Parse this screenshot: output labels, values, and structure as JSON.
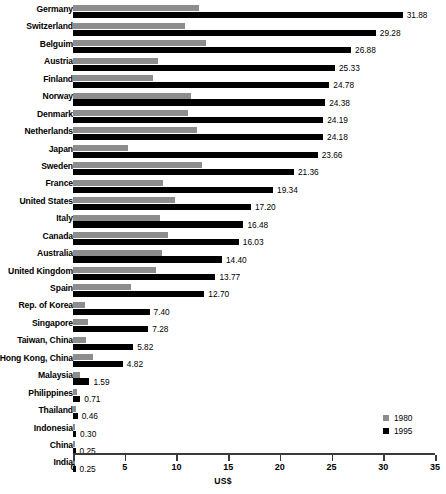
{
  "chart_data": {
    "type": "bar",
    "orientation": "horizontal",
    "title": "",
    "xlabel": "US$",
    "ylabel": "",
    "xlim": [
      0,
      35
    ],
    "xticks": [
      0,
      5,
      10,
      15,
      20,
      25,
      30,
      35
    ],
    "grid": false,
    "legend_position": "bottom-right",
    "categories": [
      "Germany",
      "Switzerland",
      "Belguim",
      "Austria",
      "Finland",
      "Norway",
      "Denmark",
      "Netherlands",
      "Japan",
      "Sweden",
      "France",
      "United States",
      "Italy",
      "Canada",
      "Australia",
      "United Kingdom",
      "Spain",
      "Rep. of Korea",
      "Singapore",
      "Taiwan, China",
      "Hong Kong, China",
      "Malaysia",
      "Philippines",
      "Thailand",
      "Indonesia",
      "China",
      "India"
    ],
    "series": [
      {
        "name": "1980",
        "color": "#8d8d8d",
        "values": [
          12.2,
          10.85,
          12.9,
          8.2,
          7.75,
          11.45,
          11.1,
          11.95,
          5.3,
          12.5,
          8.7,
          9.9,
          8.4,
          9.15,
          8.65,
          8.05,
          5.65,
          1.2,
          1.45,
          1.25,
          1.9,
          0.7,
          0.35,
          0.25,
          0.2,
          0.2,
          0.2
        ],
        "labels_shown": false
      },
      {
        "name": "1995",
        "color": "#000000",
        "values": [
          31.88,
          29.28,
          26.88,
          25.33,
          24.78,
          24.38,
          24.19,
          24.18,
          23.66,
          21.36,
          19.34,
          17.2,
          16.48,
          16.03,
          14.4,
          13.77,
          12.7,
          7.4,
          7.28,
          5.82,
          4.82,
          1.59,
          0.71,
          0.46,
          0.3,
          0.25,
          0.25
        ],
        "labels_shown": true,
        "value_labels": [
          "31.88",
          "29.28",
          "26.88",
          "25.33",
          "24.78",
          "24.38",
          "24.19",
          "24.18",
          "23.66",
          "21.36",
          "19.34",
          "17.20",
          "16.48",
          "16.03",
          "14.40",
          "13.77",
          "12.70",
          "7.40",
          "7.28",
          "5.82",
          "4.82",
          "1.59",
          "0.71",
          "0.46",
          "0.30",
          "0.25",
          "0.25"
        ]
      }
    ]
  },
  "axis": {
    "tick_labels": [
      "0",
      "5",
      "10",
      "15",
      "20",
      "25",
      "30",
      "35"
    ],
    "title": "US$"
  },
  "legend": {
    "items": [
      {
        "label": "1980",
        "color": "#8d8d8d"
      },
      {
        "label": "1995",
        "color": "#000000"
      }
    ]
  }
}
